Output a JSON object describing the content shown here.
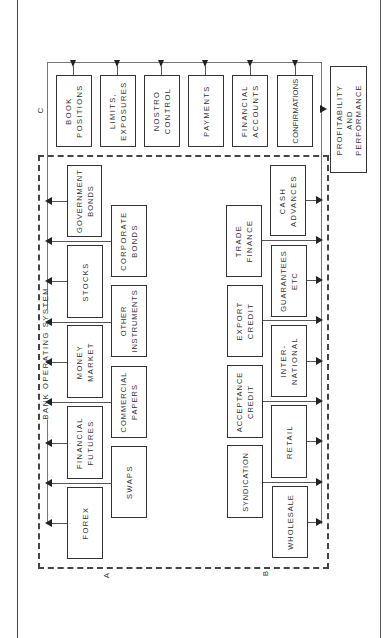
{
  "diagram": {
    "title": "BANK OPERATING SYSTEM",
    "section_labels": {
      "a": "A",
      "b": "B",
      "c": "C"
    },
    "c_modules": [
      {
        "id": "book-positions",
        "label": "BOOK\nPOSITIONS"
      },
      {
        "id": "limits-exposures",
        "label": "LIMITS,\nEXPOSURES"
      },
      {
        "id": "nostro-control",
        "label": "NOSTRO\nCONTROL"
      },
      {
        "id": "payments",
        "label": "PAYMENTS"
      },
      {
        "id": "financial-accounts",
        "label": "FINANCIAL\nACCOUNTS"
      },
      {
        "id": "confirmations",
        "label": "CONFIRMATIONS"
      }
    ],
    "output": {
      "id": "profitability-performance",
      "label": "PROFITABILITY\nAND\nPERFORMANCE"
    },
    "a_inner_column": [
      {
        "id": "forex",
        "label": "FOREX"
      },
      {
        "id": "financial-futures",
        "label": "FINANCIAL\nFUTURES"
      },
      {
        "id": "money-market",
        "label": "MONEY\nMARKET"
      },
      {
        "id": "stocks",
        "label": "STOCKS"
      },
      {
        "id": "government-bonds",
        "label": "GOVERNMENT\nBONDS"
      }
    ],
    "a_outer_column": [
      {
        "id": "swaps",
        "label": "SWAPS"
      },
      {
        "id": "commercial-papers",
        "label": "COMMERCIAL\nPAPERS"
      },
      {
        "id": "other-instruments",
        "label": "OTHER\nINSTRUMENTS"
      },
      {
        "id": "corporate-bonds",
        "label": "CORPORATE\nBONDS"
      }
    ],
    "b_outer_column": [
      {
        "id": "syndication",
        "label": "SYNDICATION"
      },
      {
        "id": "acceptance-credit",
        "label": "ACCEPTANCE\nCREDIT"
      },
      {
        "id": "export-credit",
        "label": "EXPORT\nCREDIT"
      },
      {
        "id": "trade-finance",
        "label": "TRADE\nFINANCE"
      }
    ],
    "b_inner_column": [
      {
        "id": "wholesale",
        "label": "WHOLESALE"
      },
      {
        "id": "retail",
        "label": "RETAIL"
      },
      {
        "id": "international",
        "label": "INTER-\nNATIONAL"
      },
      {
        "id": "guarantees",
        "label": "GUARANTEES\nETC"
      },
      {
        "id": "cash-advances",
        "label": "CASH\nADVANCES"
      }
    ]
  }
}
